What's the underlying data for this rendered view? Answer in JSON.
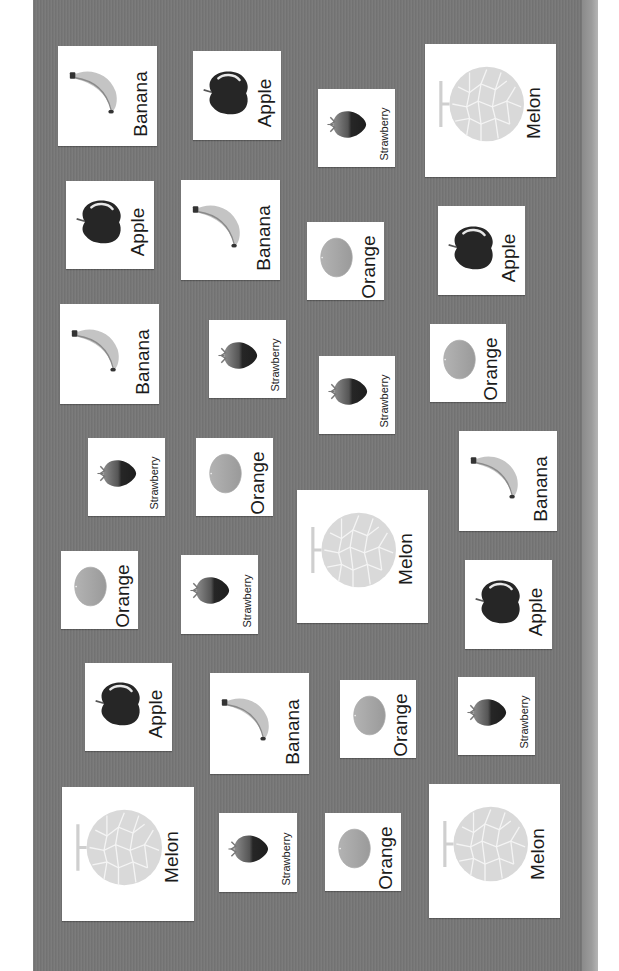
{
  "scene": {
    "description": "Photo of fruit picture cards pinned on a gray board, rotated 90 degrees",
    "colors": {
      "board": "#777777",
      "card": "#ffffff",
      "text": "#1b1b1b"
    }
  },
  "cards": [
    {
      "label": "Banana",
      "fruit": "banana",
      "x": 58,
      "y": 46,
      "w": 99,
      "h": 100
    },
    {
      "label": "Apple",
      "fruit": "apple",
      "x": 66,
      "y": 181,
      "w": 88,
      "h": 88
    },
    {
      "label": "Banana",
      "fruit": "banana",
      "x": 60,
      "y": 304,
      "w": 99,
      "h": 100
    },
    {
      "label": "Strawberry",
      "fruit": "strawberry",
      "x": 88,
      "y": 438,
      "w": 77,
      "h": 78
    },
    {
      "label": "Orange",
      "fruit": "orange",
      "x": 61,
      "y": 551,
      "w": 77,
      "h": 78
    },
    {
      "label": "Apple",
      "fruit": "apple",
      "x": 85,
      "y": 663,
      "w": 87,
      "h": 88
    },
    {
      "label": "Melon",
      "fruit": "melon",
      "x": 62,
      "y": 787,
      "w": 132,
      "h": 134
    },
    {
      "label": "Apple",
      "fruit": "apple",
      "x": 193,
      "y": 51,
      "w": 88,
      "h": 89
    },
    {
      "label": "Banana",
      "fruit": "banana",
      "x": 181,
      "y": 180,
      "w": 99,
      "h": 100
    },
    {
      "label": "Strawberry",
      "fruit": "strawberry",
      "x": 209,
      "y": 320,
      "w": 77,
      "h": 78
    },
    {
      "label": "Orange",
      "fruit": "orange",
      "x": 196,
      "y": 438,
      "w": 77,
      "h": 78
    },
    {
      "label": "Strawberry",
      "fruit": "strawberry",
      "x": 181,
      "y": 555,
      "w": 77,
      "h": 79
    },
    {
      "label": "Banana",
      "fruit": "banana",
      "x": 210,
      "y": 673,
      "w": 99,
      "h": 101
    },
    {
      "label": "Strawberry",
      "fruit": "strawberry",
      "x": 219,
      "y": 813,
      "w": 78,
      "h": 79
    },
    {
      "label": "Strawberry",
      "fruit": "strawberry",
      "x": 318,
      "y": 89,
      "w": 77,
      "h": 78
    },
    {
      "label": "Orange",
      "fruit": "orange",
      "x": 307,
      "y": 222,
      "w": 77,
      "h": 78
    },
    {
      "label": "Strawberry",
      "fruit": "strawberry",
      "x": 319,
      "y": 356,
      "w": 76,
      "h": 78
    },
    {
      "label": "Melon",
      "fruit": "melon",
      "x": 297,
      "y": 490,
      "w": 131,
      "h": 133
    },
    {
      "label": "Orange",
      "fruit": "orange",
      "x": 340,
      "y": 680,
      "w": 76,
      "h": 78
    },
    {
      "label": "Orange",
      "fruit": "orange",
      "x": 325,
      "y": 813,
      "w": 76,
      "h": 78
    },
    {
      "label": "Melon",
      "fruit": "melon",
      "x": 425,
      "y": 44,
      "w": 131,
      "h": 133
    },
    {
      "label": "Apple",
      "fruit": "apple",
      "x": 438,
      "y": 206,
      "w": 87,
      "h": 89
    },
    {
      "label": "Orange",
      "fruit": "orange",
      "x": 430,
      "y": 324,
      "w": 76,
      "h": 78
    },
    {
      "label": "Banana",
      "fruit": "banana",
      "x": 459,
      "y": 431,
      "w": 98,
      "h": 100
    },
    {
      "label": "Apple",
      "fruit": "apple",
      "x": 465,
      "y": 560,
      "w": 87,
      "h": 89
    },
    {
      "label": "Strawberry",
      "fruit": "strawberry",
      "x": 458,
      "y": 677,
      "w": 77,
      "h": 78
    },
    {
      "label": "Melon",
      "fruit": "melon",
      "x": 429,
      "y": 784,
      "w": 131,
      "h": 134
    }
  ]
}
